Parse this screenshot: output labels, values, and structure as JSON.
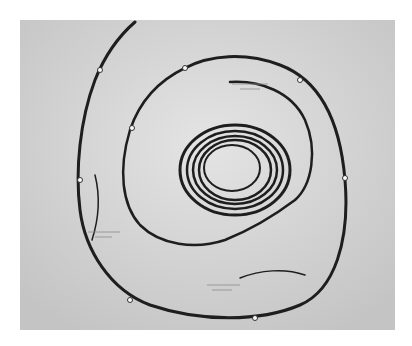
{
  "image": {
    "subject": "Coiled cords with small labels on paper",
    "background": "#d6d6d6",
    "cord_color": "#1e1e1e",
    "labels": [
      {
        "id": "label-top-right",
        "text": ""
      },
      {
        "id": "label-left",
        "text": ""
      },
      {
        "id": "label-bottom",
        "text": ""
      }
    ]
  }
}
